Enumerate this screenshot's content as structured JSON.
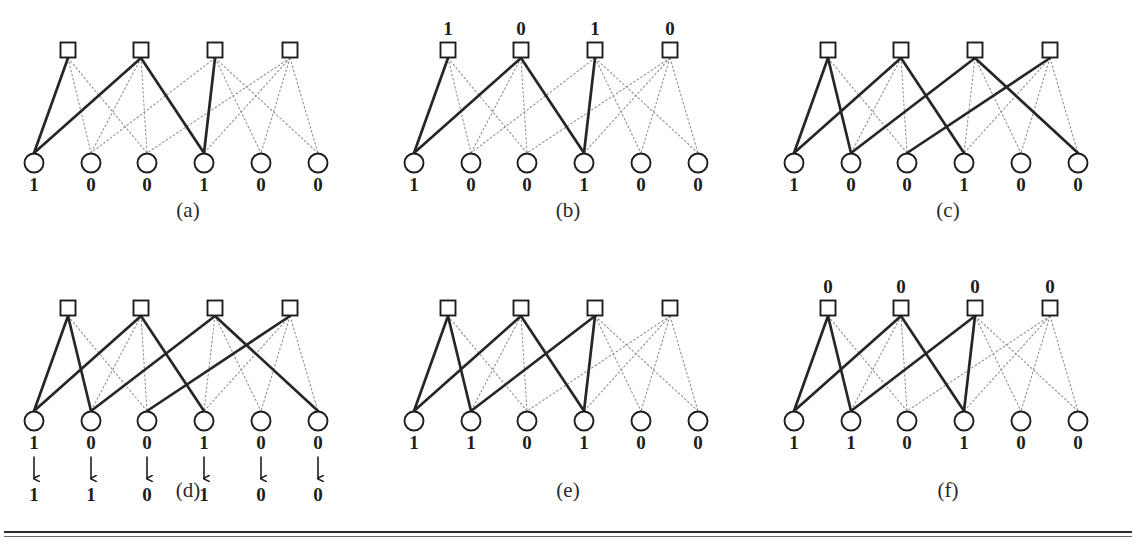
{
  "figure": {
    "node_shapes": {
      "check": "square",
      "variable": "circle"
    },
    "edge_styles": {
      "active": "bold-solid",
      "inactive": "dotted"
    },
    "colors": {
      "bold_edge": "#262626",
      "dotted_edge": "#8d8d8d",
      "node_stroke": "#1d1d1d",
      "node_fill": "#ffffff",
      "text": "#1d1d1d",
      "rule": "#2b2b2b"
    },
    "geometry": {
      "check_x": [
        68,
        141,
        215,
        290
      ],
      "var_x": [
        34,
        91,
        147,
        204,
        261,
        318
      ],
      "check_y": 50,
      "var_y": 163
    },
    "edges_all": [
      [
        0,
        0
      ],
      [
        0,
        1
      ],
      [
        0,
        2
      ],
      [
        1,
        0
      ],
      [
        1,
        1
      ],
      [
        1,
        2
      ],
      [
        1,
        3
      ],
      [
        2,
        1
      ],
      [
        2,
        3
      ],
      [
        2,
        4
      ],
      [
        2,
        5
      ],
      [
        3,
        2
      ],
      [
        3,
        3
      ],
      [
        3,
        4
      ],
      [
        3,
        5
      ]
    ]
  },
  "panels": [
    {
      "id": "a",
      "caption": "(a)",
      "check_labels": [],
      "var_labels": [
        "1",
        "0",
        "0",
        "1",
        "0",
        "0"
      ],
      "var_labels_2": [],
      "show_arrows": false,
      "bold_edges": [
        [
          0,
          0
        ],
        [
          1,
          0
        ],
        [
          1,
          3
        ],
        [
          2,
          3
        ]
      ]
    },
    {
      "id": "b",
      "caption": "(b)",
      "check_labels": [
        "1",
        "0",
        "1",
        "0"
      ],
      "var_labels": [
        "1",
        "0",
        "0",
        "1",
        "0",
        "0"
      ],
      "var_labels_2": [],
      "show_arrows": false,
      "bold_edges": [
        [
          0,
          0
        ],
        [
          1,
          0
        ],
        [
          1,
          3
        ],
        [
          2,
          3
        ]
      ]
    },
    {
      "id": "c",
      "caption": "(c)",
      "check_labels": [],
      "var_labels": [
        "1",
        "0",
        "0",
        "1",
        "0",
        "0"
      ],
      "var_labels_2": [],
      "show_arrows": false,
      "bold_edges": [
        [
          0,
          0
        ],
        [
          0,
          1
        ],
        [
          1,
          0
        ],
        [
          1,
          3
        ],
        [
          2,
          1
        ],
        [
          2,
          5
        ],
        [
          3,
          2
        ]
      ]
    },
    {
      "id": "d",
      "caption": "(d)",
      "check_labels": [],
      "var_labels": [
        "1",
        "0",
        "0",
        "1",
        "0",
        "0"
      ],
      "var_labels_2": [
        "1",
        "1",
        "0",
        "1",
        "0",
        "0"
      ],
      "show_arrows": true,
      "bold_edges": [
        [
          0,
          0
        ],
        [
          0,
          1
        ],
        [
          1,
          0
        ],
        [
          1,
          3
        ],
        [
          2,
          1
        ],
        [
          2,
          5
        ],
        [
          3,
          2
        ]
      ]
    },
    {
      "id": "e",
      "caption": "(e)",
      "check_labels": [],
      "var_labels": [
        "1",
        "1",
        "0",
        "1",
        "0",
        "0"
      ],
      "var_labels_2": [],
      "show_arrows": false,
      "bold_edges": [
        [
          0,
          0
        ],
        [
          0,
          1
        ],
        [
          1,
          0
        ],
        [
          1,
          3
        ],
        [
          2,
          1
        ],
        [
          2,
          3
        ]
      ]
    },
    {
      "id": "f",
      "caption": "(f)",
      "check_labels": [
        "0",
        "0",
        "0",
        "0"
      ],
      "var_labels": [
        "1",
        "1",
        "0",
        "1",
        "0",
        "0"
      ],
      "var_labels_2": [],
      "show_arrows": false,
      "bold_edges": [
        [
          0,
          0
        ],
        [
          0,
          1
        ],
        [
          1,
          0
        ],
        [
          1,
          3
        ],
        [
          2,
          1
        ],
        [
          2,
          3
        ]
      ]
    }
  ],
  "layout": {
    "panel_origins": [
      {
        "left": 0,
        "top": 0
      },
      {
        "left": 380,
        "top": 0
      },
      {
        "left": 760,
        "top": 0
      },
      {
        "left": 0,
        "top": 258
      },
      {
        "left": 380,
        "top": 258
      },
      {
        "left": 760,
        "top": 258
      }
    ],
    "caption_tops": [
      198,
      198,
      198,
      478,
      478,
      478
    ]
  }
}
